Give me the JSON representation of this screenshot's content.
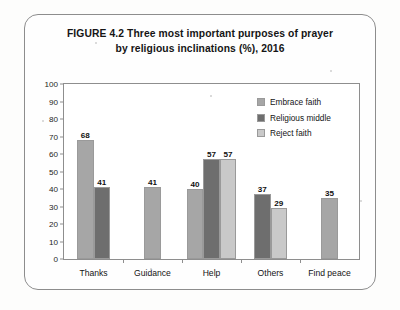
{
  "figure": {
    "title_line1": "FIGURE 4.2  Three most important purposes of prayer",
    "title_line2": "by religious inclinations (%), 2016"
  },
  "colors": {
    "embrace_faith": "#a6a6a6",
    "religious_middle": "#6e6e6e",
    "reject_faith": "#c9c9c9",
    "axis": "#8e8e8e",
    "text": "#141414",
    "frame": "#8d8d8d"
  },
  "chart_data": {
    "type": "bar",
    "title": "FIGURE 4.2  Three most important purposes of prayer by religious inclinations (%), 2016",
    "xlabel": "",
    "ylabel": "",
    "ylim": [
      0,
      100
    ],
    "yticks": [
      0,
      10,
      20,
      30,
      40,
      50,
      60,
      70,
      80,
      90,
      100
    ],
    "ytick_labels": [
      "0",
      "10",
      "20",
      "30",
      "40",
      "50",
      "60",
      "70",
      "80",
      "90",
      "100"
    ],
    "grid": false,
    "legend_position": "upper right inside",
    "categories": [
      "Thanks",
      "Guidance",
      "Help",
      "Others",
      "Find peace"
    ],
    "series": [
      {
        "name": "Embrace faith",
        "color": "#a6a6a6",
        "values": [
          68,
          41,
          40,
          null,
          35
        ],
        "labels": [
          "68",
          "41",
          "40",
          "",
          "35"
        ]
      },
      {
        "name": "Religious middle",
        "color": "#6e6e6e",
        "values": [
          41,
          null,
          57,
          37,
          null
        ],
        "labels": [
          "41",
          "",
          "57",
          "37",
          ""
        ]
      },
      {
        "name": "Reject faith",
        "color": "#c9c9c9",
        "values": [
          null,
          null,
          57,
          29,
          null
        ],
        "labels": [
          "",
          "",
          "57",
          "29",
          ""
        ]
      }
    ]
  }
}
